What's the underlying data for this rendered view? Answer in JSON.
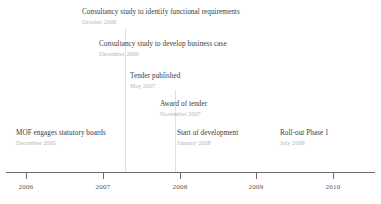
{
  "figure": {
    "type": "timeline",
    "background_color": "#ffffff",
    "axis_color": "#6d6b69",
    "title_color": "#3a3a3c",
    "date_color": "#b9b6b4",
    "connector_color": "#e4e2e0"
  },
  "axis": {
    "ticks": [
      {
        "label": "2006",
        "x": 26
      },
      {
        "label": "2007",
        "x": 103
      },
      {
        "label": "2008",
        "x": 180
      },
      {
        "label": "2009",
        "x": 256
      },
      {
        "label": "2010",
        "x": 333
      }
    ],
    "range_start": "2006",
    "range_end": "2010"
  },
  "milestones": [
    {
      "title": "Consultancy study to identify functional requirements",
      "date": "October 2006",
      "x": 82,
      "y": 9
    },
    {
      "title": "Consultancy study to develop business case",
      "date": "December 2006",
      "x": 99,
      "y": 41
    },
    {
      "title": "Tender published",
      "date": "May 2007",
      "x": 130,
      "y": 73
    },
    {
      "title": "Award of tender",
      "date": "November 2007",
      "x": 160,
      "y": 101
    },
    {
      "title": "MOF engages statutory boards",
      "date": "December 2005",
      "x": 16,
      "y": 130
    },
    {
      "title": "Start of development",
      "date": "January 2008",
      "x": 177,
      "y": 130
    },
    {
      "title": "Roll-out Phase 1",
      "date": "July 2009",
      "x": 280,
      "y": 130
    }
  ],
  "connectors": [
    {
      "x": 125,
      "y_top": 28,
      "height": 144
    },
    {
      "x": 175,
      "y_top": 90,
      "height": 82
    }
  ],
  "chart_data": {
    "type": "timeline",
    "title": "",
    "xlabel": "",
    "ylabel": "",
    "axis_ticks": [
      "2006",
      "2007",
      "2008",
      "2009",
      "2010"
    ],
    "xlim": [
      "2006",
      "2010"
    ],
    "grid": false,
    "legend": "none",
    "events": [
      {
        "label": "MOF engages statutory boards",
        "date": "December 2005"
      },
      {
        "label": "Consultancy study to identify functional requirements",
        "date": "October 2006"
      },
      {
        "label": "Consultancy study to develop business case",
        "date": "December 2006"
      },
      {
        "label": "Tender published",
        "date": "May 2007"
      },
      {
        "label": "Award of tender",
        "date": "November 2007"
      },
      {
        "label": "Start of development",
        "date": "January 2008"
      },
      {
        "label": "Roll-out Phase 1",
        "date": "July 2009"
      }
    ]
  }
}
